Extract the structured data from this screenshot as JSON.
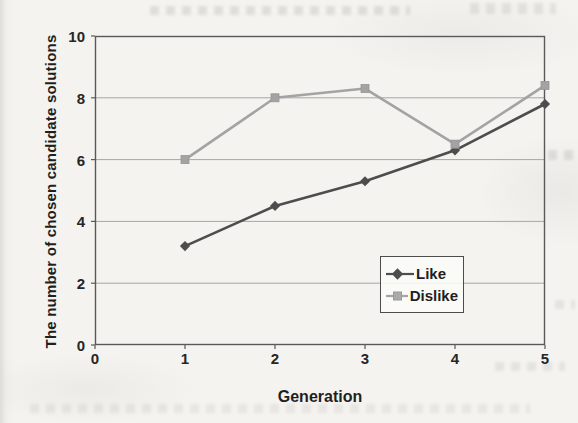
{
  "figure": {
    "kind": "scanned-paper-figure"
  },
  "colors": {
    "paper": "#f4f3ef",
    "plot_border": "#595959",
    "gridline": "#a6a6a6",
    "text": "#262626",
    "like_line": "#4d4d4d",
    "dislike_line": "#a3a3a3"
  },
  "chart_data": {
    "type": "line",
    "title": "",
    "xlabel": "Generation",
    "ylabel": "The number of chosen candidate solutions",
    "x": [
      1,
      2,
      3,
      4,
      5
    ],
    "series": [
      {
        "name": "Like",
        "values": [
          3.2,
          4.5,
          5.3,
          6.3,
          7.8
        ],
        "color": "#4d4d4d",
        "marker": "diamond"
      },
      {
        "name": "Dislike",
        "values": [
          6.0,
          8.0,
          8.3,
          6.5,
          8.4
        ],
        "color": "#a3a3a3",
        "marker": "square"
      }
    ],
    "xlim": [
      0,
      5
    ],
    "ylim": [
      0,
      10
    ],
    "x_ticks": [
      "0",
      "1",
      "2",
      "3",
      "4",
      "5"
    ],
    "y_ticks": [
      "0",
      "2",
      "4",
      "6",
      "8",
      "10"
    ],
    "grid": "horizontal",
    "legend_position": "inside-lower-right"
  }
}
